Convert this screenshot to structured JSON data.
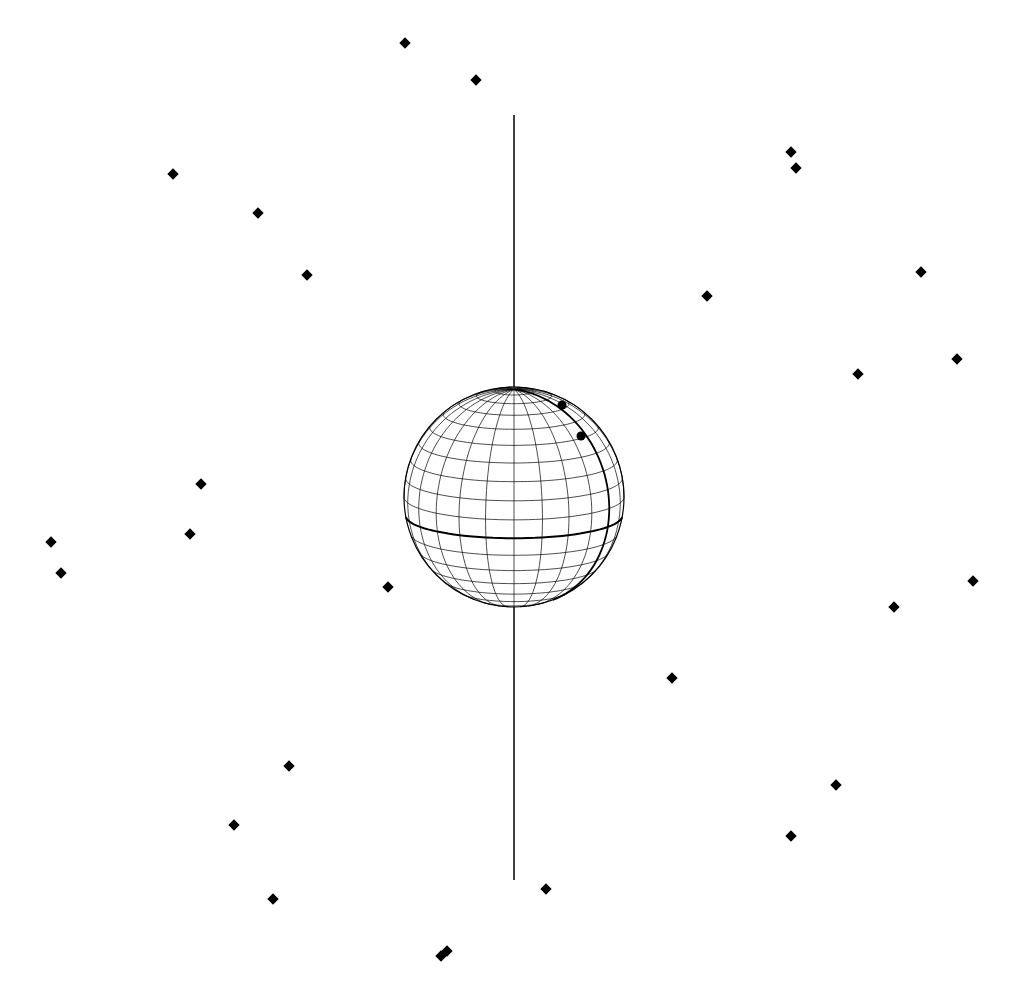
{
  "diagram": {
    "type": "celestial-sphere",
    "colors": {
      "background": "#ffffff",
      "ink": "#000000"
    },
    "axis": {
      "x": 514,
      "y_top": 115,
      "y_bottom": 880
    },
    "sphere": {
      "cx": 514,
      "cy": 497,
      "r": 110,
      "latitude_lines": 18,
      "longitude_lines": 24,
      "tilt_deg": 12
    },
    "sphere_points": [
      {
        "x": 562,
        "y": 405
      },
      {
        "x": 581,
        "y": 436
      }
    ],
    "stars": [
      {
        "x": 405,
        "y": 43
      },
      {
        "x": 476,
        "y": 80
      },
      {
        "x": 173,
        "y": 174
      },
      {
        "x": 258,
        "y": 213
      },
      {
        "x": 307,
        "y": 275
      },
      {
        "x": 791,
        "y": 152
      },
      {
        "x": 796,
        "y": 168
      },
      {
        "x": 921,
        "y": 272
      },
      {
        "x": 707,
        "y": 296
      },
      {
        "x": 957,
        "y": 359
      },
      {
        "x": 858,
        "y": 374
      },
      {
        "x": 201,
        "y": 484
      },
      {
        "x": 190,
        "y": 534
      },
      {
        "x": 51,
        "y": 542
      },
      {
        "x": 61,
        "y": 573
      },
      {
        "x": 388,
        "y": 587
      },
      {
        "x": 973,
        "y": 581
      },
      {
        "x": 894,
        "y": 607
      },
      {
        "x": 672,
        "y": 678
      },
      {
        "x": 289,
        "y": 766
      },
      {
        "x": 836,
        "y": 785
      },
      {
        "x": 234,
        "y": 825
      },
      {
        "x": 791,
        "y": 836
      },
      {
        "x": 546,
        "y": 889
      },
      {
        "x": 273,
        "y": 899
      },
      {
        "x": 447,
        "y": 951
      },
      {
        "x": 441,
        "y": 956
      }
    ]
  }
}
